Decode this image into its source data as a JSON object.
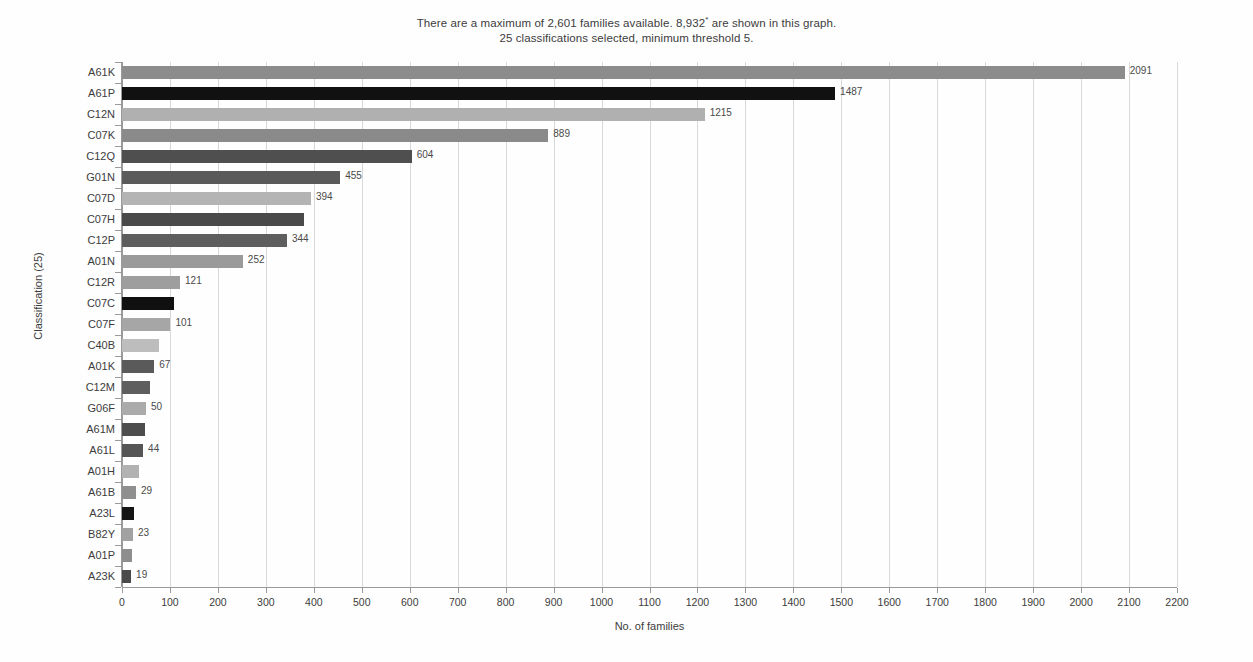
{
  "title": {
    "line1_a": "There are a maximum of 2,601 families available. 8,932",
    "line1_sup": "*",
    "line1_b": " are shown in this graph.",
    "line2": "25 classifications selected, minimum threshold 5."
  },
  "chart_data": {
    "type": "bar",
    "orientation": "horizontal",
    "title": "There are a maximum of 2,601 families available. 8,932* are shown in this graph. 25 classifications selected, minimum threshold 5.",
    "xlabel": "No. of families",
    "ylabel": "Classification (25)",
    "xlim": [
      0,
      2200
    ],
    "xticks": [
      0,
      100,
      200,
      300,
      400,
      500,
      600,
      700,
      800,
      900,
      1000,
      1100,
      1200,
      1300,
      1400,
      1500,
      1600,
      1700,
      1800,
      1900,
      2000,
      2100,
      2200
    ],
    "grid": true,
    "legend": "none",
    "categories": [
      "A61K",
      "A61P",
      "C12N",
      "C07K",
      "C12Q",
      "G01N",
      "C07D",
      "C07H",
      "C12P",
      "A01N",
      "C12R",
      "C07C",
      "C07F",
      "C40B",
      "A01K",
      "C12M",
      "G06F",
      "A61M",
      "A61L",
      "A01H",
      "A61B",
      "A23L",
      "B82Y",
      "A01P",
      "A23K"
    ],
    "values": [
      2091,
      1487,
      1215,
      889,
      604,
      455,
      394,
      380,
      344,
      252,
      121,
      108,
      101,
      77,
      67,
      58,
      50,
      47,
      44,
      35,
      29,
      26,
      23,
      21,
      19
    ],
    "value_labels": [
      "2091",
      "1487",
      "1215",
      "889",
      "604",
      "455",
      "394",
      "",
      "344",
      "252",
      "121",
      "",
      "101",
      "",
      "67",
      "",
      "50",
      "",
      "44",
      "",
      "29",
      "",
      "23",
      "",
      "19"
    ],
    "bar_colors": [
      "#8c8c8c",
      "#111111",
      "#b0b0b0",
      "#8a8a8a",
      "#4f4f4f",
      "#5a5a5a",
      "#b4b4b4",
      "#4a4a4a",
      "#5e5e5e",
      "#9a9a9a",
      "#9e9e9e",
      "#101010",
      "#a6a6a6",
      "#bdbdbd",
      "#5a5a5a",
      "#5e5e5e",
      "#ababab",
      "#4d4d4d",
      "#555555",
      "#b2b2b2",
      "#8f8f8f",
      "#151515",
      "#a2a2a2",
      "#8e8e8e",
      "#4a4a4a"
    ]
  },
  "colors": {
    "gridline": "#d8d8d8",
    "axis": "#9a9a9a",
    "text": "#3c3c3c",
    "value_text": "#4a4a4a",
    "background": "#fefefe"
  }
}
